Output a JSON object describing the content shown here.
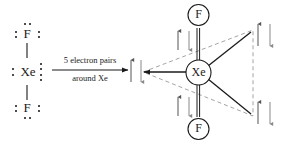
{
  "diagram": {
    "reaction_label": {
      "above": "5 electron pairs",
      "below": "around Xe"
    },
    "lewis_structure": {
      "name": "XeF2 Lewis dot structure",
      "atoms": [
        {
          "symbol": "F",
          "role": "top-fluorine"
        },
        {
          "symbol": "Xe",
          "role": "central-xenon"
        },
        {
          "symbol": "F",
          "role": "bottom-fluorine"
        }
      ],
      "bonds": [
        "Xe-F top single bond",
        "Xe-F bottom single bond"
      ],
      "lone_pairs_note": "3 lone pairs on each F, 3 lone pairs on Xe"
    },
    "geometry_structure": {
      "name": "trigonal bipyramidal electron geometry",
      "central_atom": "Xe",
      "axial_atoms": [
        {
          "symbol": "F",
          "position": "axial-top"
        },
        {
          "symbol": "F",
          "position": "axial-bottom"
        }
      ],
      "equatorial_lone_pairs": [
        {
          "position": "equatorial-left"
        },
        {
          "position": "equatorial-upper-right"
        },
        {
          "position": "equatorial-lower-right"
        }
      ],
      "electron_pair_arrows": [
        {
          "position": "axial-top",
          "symbols": "up-down"
        },
        {
          "position": "axial-bottom",
          "symbols": "up-down"
        },
        {
          "position": "equatorial-left",
          "symbols": "up-down"
        },
        {
          "position": "equatorial-upper-right",
          "symbols": "up-down"
        },
        {
          "position": "equatorial-lower-right",
          "symbols": "up-down"
        }
      ]
    },
    "colors": {
      "stroke": "#1a1a1a",
      "dashed": "#8a8a8a",
      "background": "#ffffff"
    }
  }
}
